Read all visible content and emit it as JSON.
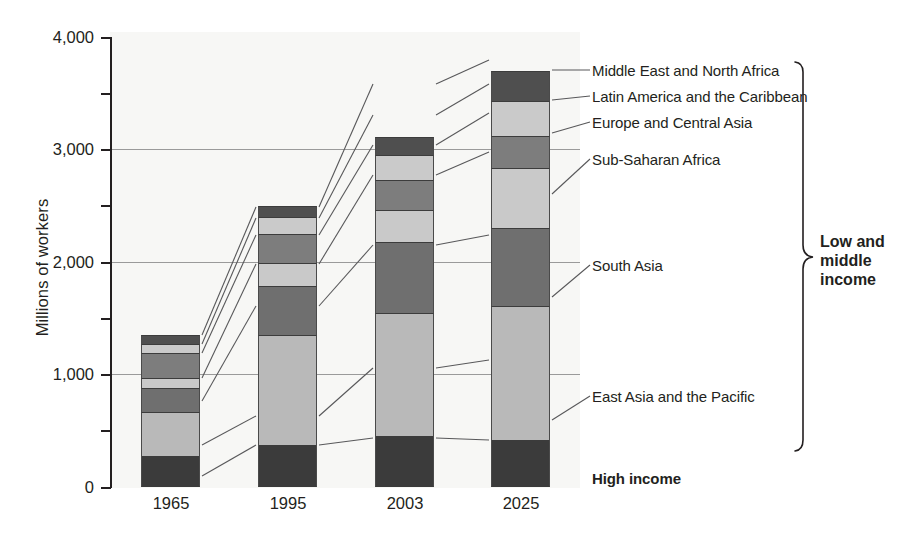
{
  "chart_data": {
    "type": "bar",
    "subtype": "stacked-bar",
    "title": "",
    "xlabel": "",
    "ylabel": "Millions of workers",
    "ylim": [
      0,
      4000
    ],
    "ytick_values": [
      0,
      1000,
      2000,
      3000,
      4000
    ],
    "ytick_labels": [
      "0",
      "1,000",
      "2,000",
      "3,000",
      "4,000"
    ],
    "yminor_tick_values": [
      500,
      1500,
      2500,
      3500
    ],
    "grid": "horizontal gridlines at 1,000 / 2,000 / 3,000",
    "legend_position": "right, leader lines to segments",
    "categories": [
      "1965",
      "1995",
      "2003",
      "2025"
    ],
    "series": [
      {
        "name": "High income",
        "color": "#3b3b3b",
        "values": [
          280,
          370,
          450,
          420
        ]
      },
      {
        "name": "East Asia and the Pacific",
        "color": "#b9b9b9",
        "values": [
          390,
          980,
          1100,
          1190
        ]
      },
      {
        "name": "South Asia",
        "color": "#6f6f6f",
        "values": [
          210,
          440,
          630,
          690
        ]
      },
      {
        "name": "Sub-Saharan Africa",
        "color": "#c9c9c9",
        "values": [
          90,
          200,
          280,
          540
        ]
      },
      {
        "name": "Europe and Central Asia",
        "color": "#7d7d7d",
        "values": [
          220,
          260,
          270,
          280
        ]
      },
      {
        "name": "Latin America and the Caribbean",
        "color": "#cacaca",
        "values": [
          80,
          150,
          220,
          310
        ]
      },
      {
        "name": "Middle East and North Africa",
        "color": "#4f4f4f",
        "values": [
          80,
          100,
          160,
          270
        ]
      }
    ],
    "totals": [
      1350,
      2500,
      3110,
      3700
    ]
  },
  "legend": {
    "items": [
      {
        "label": "Middle East and North Africa"
      },
      {
        "label": "Latin America and the Caribbean"
      },
      {
        "label": "Europe and Central Asia"
      },
      {
        "label": "Sub-Saharan Africa"
      },
      {
        "label": "South Asia"
      },
      {
        "label": "East Asia and the Pacific"
      }
    ],
    "high_income_label": "High income",
    "group_bracket_label_line1": "Low and",
    "group_bracket_label_line2": "middle",
    "group_bracket_label_line3": "income"
  }
}
